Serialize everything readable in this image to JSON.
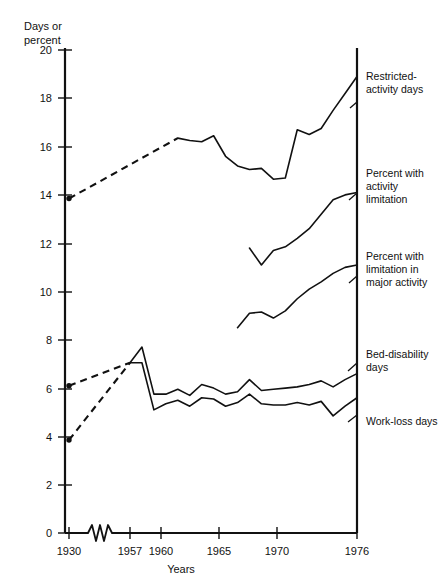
{
  "chart_data": {
    "type": "line",
    "title": "",
    "ylabel_line1": "Days or",
    "ylabel_line2": "percent",
    "xlabel": "Years",
    "ylim": [
      0,
      20
    ],
    "yticks": [
      0,
      2,
      4,
      6,
      8,
      10,
      12,
      14,
      16,
      18,
      20
    ],
    "ytick_labels": [
      "0",
      "2",
      "4",
      "6",
      "8",
      "10",
      "12",
      "14",
      "16",
      "18",
      "20"
    ],
    "xticks": [
      1930,
      1957,
      1960,
      1965,
      1970,
      1976
    ],
    "xtick_labels": [
      "1930",
      "1957",
      "1960",
      "1965",
      "1970",
      "1976"
    ],
    "axis_break": true,
    "axis_break_note": "zigzag break on x-axis between 1930 and 1957",
    "grid": false,
    "legend_position": "right-inline-labels",
    "series": [
      {
        "name": "Restricted-activity days",
        "label": "Restricted-\nactivity days",
        "label_lines": [
          "Restricted-",
          "activity days"
        ],
        "style": "solid-with-dashed-lead",
        "marker_at_start": true,
        "dashed_segment": {
          "from_year": 1930,
          "from_value": 13.85,
          "to_year": 1961,
          "to_value": 16.35
        },
        "x": [
          1930,
          1961,
          1962,
          1963,
          1964,
          1965,
          1966,
          1967,
          1968,
          1969,
          1970,
          1971,
          1972,
          1973,
          1974,
          1975,
          1976
        ],
        "y": [
          13.85,
          16.35,
          16.25,
          16.2,
          16.45,
          15.6,
          15.2,
          15.05,
          15.1,
          14.65,
          14.7,
          16.7,
          16.5,
          16.75,
          17.5,
          18.2,
          18.9
        ]
      },
      {
        "name": "Percent with activity limitation",
        "label_lines": [
          "Percent with",
          "activity",
          "limitation"
        ],
        "style": "solid",
        "x": [
          1967,
          1968,
          1969,
          1970,
          1971,
          1972,
          1973,
          1974,
          1975,
          1976
        ],
        "y": [
          11.8,
          11.1,
          11.7,
          11.85,
          12.2,
          12.6,
          13.2,
          13.8,
          14.0,
          14.1
        ]
      },
      {
        "name": "Percent with limitation in major activity",
        "label_lines": [
          "Percent with",
          "limitation in",
          "major activity"
        ],
        "style": "solid",
        "x": [
          1966,
          1967,
          1968,
          1969,
          1970,
          1971,
          1972,
          1973,
          1974,
          1975,
          1976
        ],
        "y": [
          8.5,
          9.1,
          9.15,
          8.9,
          9.2,
          9.7,
          10.1,
          10.4,
          10.75,
          11.0,
          11.1
        ]
      },
      {
        "name": "Bed-disability days",
        "label_lines": [
          "Bed-disability",
          "days"
        ],
        "style": "solid-with-dashed-lead",
        "marker_at_start": true,
        "dashed_segment": {
          "from_year": 1930,
          "from_value": 6.1,
          "to_year": 1957,
          "to_value": 7.05
        },
        "x": [
          1930,
          1957,
          1958,
          1959,
          1960,
          1961,
          1962,
          1963,
          1964,
          1965,
          1966,
          1967,
          1968,
          1969,
          1970,
          1971,
          1972,
          1973,
          1974,
          1975,
          1976
        ],
        "y": [
          6.1,
          7.05,
          7.7,
          5.75,
          5.75,
          5.95,
          5.7,
          6.15,
          6.0,
          5.75,
          5.85,
          6.35,
          5.9,
          5.95,
          6.0,
          6.05,
          6.15,
          6.3,
          6.05,
          6.35,
          6.6
        ]
      },
      {
        "name": "Work-loss days",
        "label_lines": [
          "Work-loss days"
        ],
        "style": "solid-with-dashed-lead",
        "marker_at_start": true,
        "dashed_segment": {
          "from_year": 1930,
          "from_value": 3.85,
          "to_year": 1957,
          "to_value": 7.05
        },
        "x": [
          1930,
          1957,
          1958,
          1959,
          1960,
          1961,
          1962,
          1963,
          1964,
          1965,
          1966,
          1967,
          1968,
          1969,
          1970,
          1971,
          1972,
          1973,
          1974,
          1975,
          1976
        ],
        "y": [
          3.85,
          7.05,
          7.05,
          5.1,
          5.35,
          5.5,
          5.25,
          5.6,
          5.55,
          5.25,
          5.4,
          5.75,
          5.35,
          5.3,
          5.3,
          5.4,
          5.3,
          5.45,
          4.85,
          5.25,
          5.6
        ]
      }
    ]
  },
  "axis": {
    "y_title_line1": "Days or",
    "y_title_line2": "percent",
    "x_title": "Years"
  },
  "labels": {
    "restricted_1": "Restricted-",
    "restricted_2": "activity days",
    "activity_1": "Percent with",
    "activity_2": "activity",
    "activity_3": "limitation",
    "major_1": "Percent with",
    "major_2": "limitation in",
    "major_3": "major activity",
    "bed_1": "Bed-disability",
    "bed_2": "days",
    "work_1": "Work-loss days"
  },
  "ticks": {
    "y": [
      "20",
      "18",
      "16",
      "14",
      "12",
      "10",
      "8",
      "6",
      "4",
      "2",
      "0"
    ],
    "x": [
      "1930",
      "1957",
      "1960",
      "1965",
      "1970",
      "1976"
    ]
  },
  "colors": {
    "line": "#111111",
    "axis": "#111111",
    "background": "#ffffff"
  }
}
